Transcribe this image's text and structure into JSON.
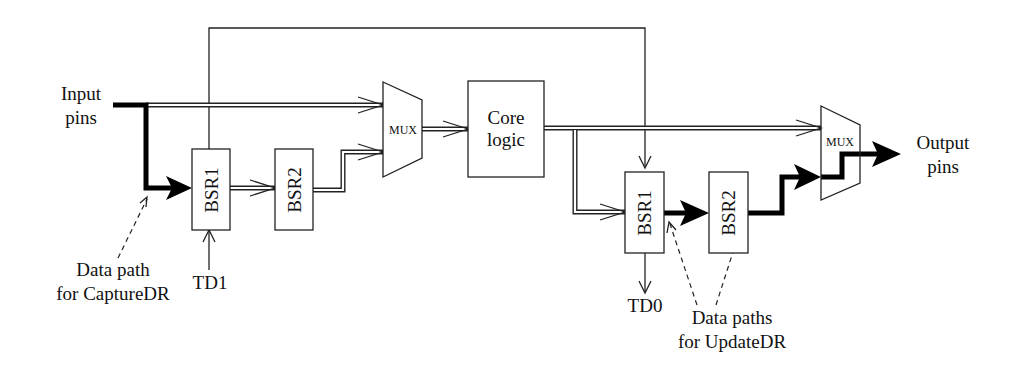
{
  "diagram": {
    "labels": {
      "input_pins_line1": "Input",
      "input_pins_line2": "pins",
      "output_pins_line1": "Output",
      "output_pins_line2": "pins",
      "tdi": "TD1",
      "tdo": "TD0",
      "capture_line1": "Data path",
      "capture_line2": "for CaptureDR",
      "update_line1": "Data paths",
      "update_line2": "for UpdateDR"
    },
    "blocks": {
      "left_bsr1": "BSR1",
      "left_bsr2": "BSR2",
      "right_bsr1": "BSR1",
      "right_bsr2": "BSR2",
      "left_mux": "MUX",
      "right_mux": "MUX",
      "core_line1": "Core",
      "core_line2": "logic"
    },
    "colors": {
      "line": "#222222",
      "highlight_path": "#000000",
      "background": "#ffffff"
    }
  }
}
